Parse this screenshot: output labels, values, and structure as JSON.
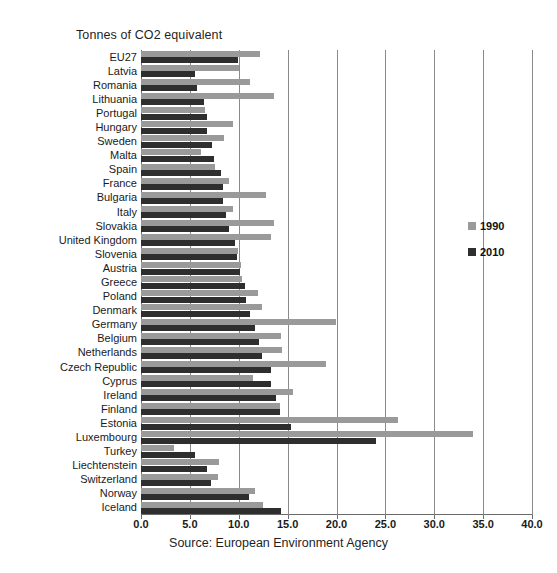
{
  "chart_data": {
    "type": "bar",
    "orientation": "horizontal",
    "title": "Tonnes of CO2 equivalent",
    "subtitle": "",
    "xlabel": "",
    "ylabel": "",
    "caption": "Source: European Environment Agency",
    "xlim": [
      0.0,
      40.0
    ],
    "xticks": [
      "0.0",
      "5.0",
      "10.0",
      "15.0",
      "20.0",
      "25.0",
      "30.0",
      "35.0",
      "40.0"
    ],
    "xtick_values": [
      0,
      5,
      10,
      15,
      20,
      25,
      30,
      35,
      40
    ],
    "grid": "vertical",
    "legend_position": "right",
    "colors": {
      "series_1990": "#9a9a9a",
      "series_2010": "#2e2e2e",
      "gridline": "#8a8a8a",
      "axis": "#6b6b6b",
      "text": "#1a1a1a",
      "background": "#ffffff"
    },
    "categories": [
      "EU27",
      "Latvia",
      "Romania",
      "Lithuania",
      "Portugal",
      "Hungary",
      "Sweden",
      "Malta",
      "Spain",
      "France",
      "Bulgaria",
      "Italy",
      "Slovakia",
      "United Kingdom",
      "Slovenia",
      "Austria",
      "Greece",
      "Poland",
      "Denmark",
      "Germany",
      "Belgium",
      "Netherlands",
      "Czech Republic",
      "Cyprus",
      "Ireland",
      "Finland",
      "Estonia",
      "Luxembourg",
      "Turkey",
      "Liechtenstein",
      "Switzerland",
      "Norway",
      "Iceland"
    ],
    "series": [
      {
        "name": "1990",
        "color": "#9a9a9a",
        "values": [
          12.2,
          10.0,
          11.1,
          13.6,
          6.5,
          9.4,
          8.5,
          6.1,
          7.6,
          9.0,
          12.8,
          9.4,
          13.6,
          13.3,
          9.9,
          10.2,
          10.3,
          12.0,
          12.4,
          19.9,
          14.3,
          14.4,
          18.9,
          11.5,
          15.5,
          14.2,
          26.3,
          34.0,
          3.4,
          8.0,
          7.9,
          11.7,
          12.5
        ]
      },
      {
        "name": "2010",
        "color": "#2e2e2e",
        "values": [
          9.9,
          5.5,
          5.7,
          6.4,
          6.8,
          6.8,
          7.3,
          7.5,
          8.2,
          8.4,
          8.4,
          8.7,
          9.0,
          9.6,
          9.8,
          10.1,
          10.6,
          10.7,
          11.2,
          11.7,
          12.1,
          12.4,
          13.3,
          13.3,
          13.8,
          14.2,
          15.3,
          24.0,
          5.5,
          6.8,
          7.2,
          11.0,
          14.3
        ]
      }
    ],
    "legend": [
      {
        "label": "1990",
        "color": "#9a9a9a"
      },
      {
        "label": "2010",
        "color": "#2e2e2e"
      }
    ]
  }
}
